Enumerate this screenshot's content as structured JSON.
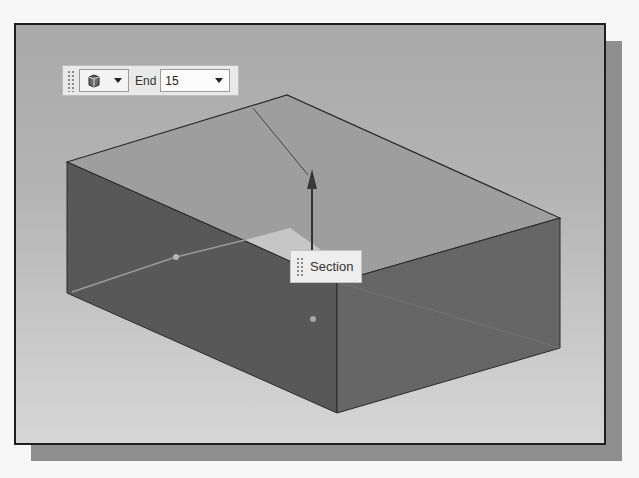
{
  "toolbar": {
    "type_selector": {
      "icon": "extrude-body-icon",
      "dropdown_icon": "chevron-down-icon"
    },
    "end_label": "End",
    "end_value": "15",
    "end_dropdown_icon": "chevron-down-icon"
  },
  "manipulator": {
    "label": "Section",
    "arrow_icon": "direction-arrow-icon"
  },
  "colors": {
    "frame_border": "#1e1e1e",
    "shadow": "#8e8e8e",
    "top_face": "#9d9d9d",
    "left_face": "#5a5a5a",
    "front_face": "#676767",
    "section_plane": "#cfcfcf"
  }
}
